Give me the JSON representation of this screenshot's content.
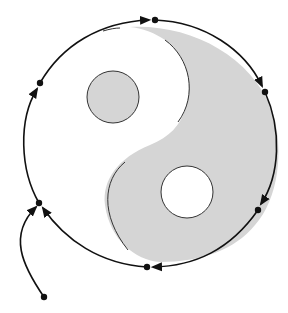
{
  "diagram": {
    "title": "",
    "type": "yin-yang-orbit",
    "colors": {
      "background": "#ffffff",
      "shaded_region": "#d5d5d5",
      "stroke": "#111111",
      "dots": "#111111"
    },
    "outer_circle": {
      "cx": 150,
      "cy": 145,
      "rx": 127,
      "ry": 125
    },
    "inner_circles": [
      {
        "name": "upper-eye",
        "cx": 113,
        "cy": 97,
        "r": 26,
        "fill": "shaded"
      },
      {
        "name": "lower-eye",
        "cx": 187,
        "cy": 192,
        "r": 26,
        "fill": "white"
      }
    ],
    "orbit_points": [
      {
        "name": "start",
        "x": 44,
        "y": 297
      },
      {
        "name": "left-lower",
        "x": 39,
        "y": 203
      },
      {
        "name": "left-upper",
        "x": 40,
        "y": 83
      },
      {
        "name": "top",
        "x": 155,
        "y": 20
      },
      {
        "name": "right",
        "x": 265,
        "y": 92
      },
      {
        "name": "right-lower",
        "x": 258,
        "y": 210
      },
      {
        "name": "bottom",
        "x": 147,
        "y": 267
      }
    ],
    "labels": []
  }
}
